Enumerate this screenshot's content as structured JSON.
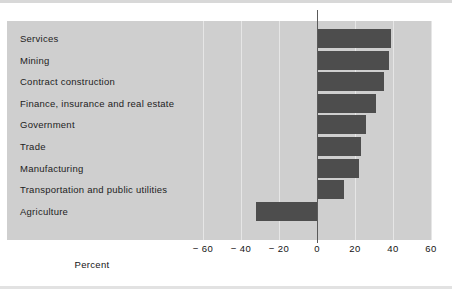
{
  "chart_data": {
    "type": "bar",
    "orientation": "horizontal",
    "title": "",
    "subtitle": "",
    "xlabel": "Percent",
    "ylabel": "",
    "xlim": [
      -70,
      70
    ],
    "grid": true,
    "legend": false,
    "zero_line": true,
    "xticks": [
      -60,
      -40,
      -20,
      0,
      20,
      40,
      60
    ],
    "xtick_labels": [
      "− 60",
      "− 40",
      "− 20",
      "0",
      "20",
      "40",
      "60"
    ],
    "categories": [
      "Services",
      "Mining",
      "Contract construction",
      "Finance, insurance and real estate",
      "Government",
      "Trade",
      "Manufacturing",
      "Transportation and public utilities",
      "Agriculture"
    ],
    "values": [
      39,
      38,
      35,
      31,
      26,
      23,
      22,
      14,
      -32
    ],
    "bar_color": "#4d4d4d",
    "panel_color": "#cfcfcf",
    "gridline_color": "#e6e6e6",
    "axis_color": "#5a5a5a"
  }
}
